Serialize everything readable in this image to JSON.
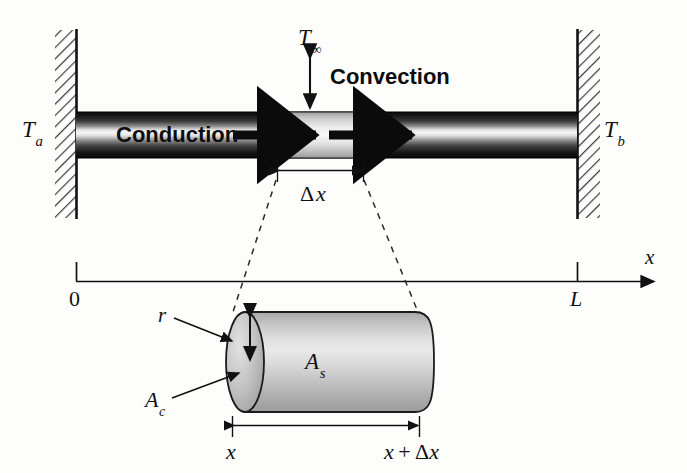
{
  "figure": {
    "labels": {
      "wall_left_temp": "T",
      "wall_left_temp_sub": "a",
      "wall_right_temp": "T",
      "wall_right_temp_sub": "b",
      "ambient_temp": "T",
      "ambient_temp_sub": "∞",
      "convection": "Convection",
      "conduction": "Conduction",
      "delta_x": "Δx",
      "axis_x": "x",
      "origin": "0",
      "length": "L",
      "radius": "r",
      "area_cross": "A",
      "area_cross_sub": "c",
      "area_surface": "A",
      "area_surface_sub": "s",
      "detail_left": "x",
      "detail_right": "x + Δx"
    },
    "colors": {
      "ink": "#111111",
      "rod_dark": "#111111",
      "rod_light": "#f2f2f2",
      "element_fill": "#d8d8d8",
      "cylinder_fill": "#b9b9b9",
      "cylinder_highlight": "#e6e6e6",
      "page_background": "#fdfdfc",
      "hatch": "#3a3a3a"
    },
    "geometry": {
      "wall_left_x": 76,
      "wall_right_x": 577,
      "rod_top_y": 112,
      "rod_bottom_y": 157,
      "element_left_x": 277,
      "element_right_x": 363,
      "axis_y": 281,
      "axis_end_x": 658,
      "cylinder_left_x": 232,
      "cylinder_right_x": 432,
      "cylinder_top_y": 312,
      "cylinder_bottom_y": 412
    }
  }
}
